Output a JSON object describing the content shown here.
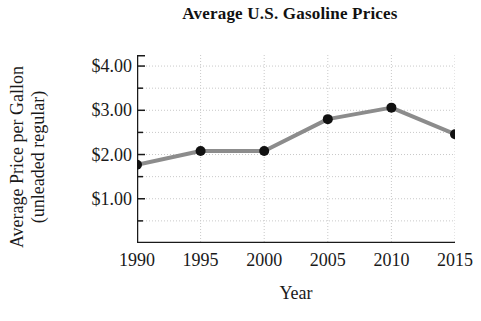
{
  "chart_data": {
    "type": "line",
    "title": "Average U.S. Gasoline Prices",
    "xlabel": "Year",
    "ylabel": "Average Price per Gallon (unleaded regular)",
    "ylabel_line1": "Average Price per Gallon",
    "ylabel_line2": "(unleaded regular)",
    "x": [
      1990,
      1995,
      2000,
      2005,
      2010,
      2015
    ],
    "categories": [
      "1990",
      "1995",
      "2000",
      "2005",
      "2010",
      "2015"
    ],
    "values": [
      1.77,
      2.08,
      2.08,
      2.8,
      3.06,
      2.46
    ],
    "value_labels": [
      "$1.77",
      "$2.08",
      "$2.08",
      "$2.80",
      "$3.06",
      "$2.46"
    ],
    "xlim": [
      1990,
      2015
    ],
    "ylim": [
      0.0,
      4.25
    ],
    "ytick_values": [
      1.0,
      2.0,
      3.0,
      4.0
    ],
    "ytick_labels": [
      "$1.00",
      "$2.00",
      "$3.00",
      "$4.00"
    ],
    "yminor_tick_values": [
      0.5,
      1.5,
      2.5,
      3.5
    ],
    "xtick_labels": [
      "1990",
      "1995",
      "2000",
      "2005",
      "2010",
      "2015"
    ],
    "grid": "dotted major and minor gridlines, light gray",
    "legend": "none",
    "series_color": "#8c8c8c",
    "marker_color": "#111111",
    "grid_color": "#c9c9c9",
    "axis_color": "#1a1a1a"
  }
}
